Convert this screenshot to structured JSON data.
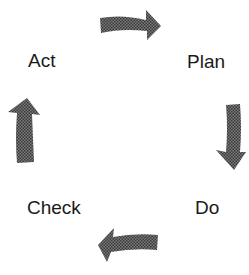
{
  "diagram": {
    "type": "cycle",
    "title": "",
    "nodes": [
      {
        "id": "plan",
        "label": "Plan"
      },
      {
        "id": "do",
        "label": "Do"
      },
      {
        "id": "check",
        "label": "Check"
      },
      {
        "id": "act",
        "label": "Act"
      }
    ],
    "edges": [
      {
        "from": "act",
        "to": "plan",
        "direction": "right"
      },
      {
        "from": "plan",
        "to": "do",
        "direction": "down"
      },
      {
        "from": "do",
        "to": "check",
        "direction": "left"
      },
      {
        "from": "check",
        "to": "act",
        "direction": "up"
      }
    ],
    "colors": {
      "arrow_fill": "#5a5a5a",
      "text": "#1a1a1a",
      "background": "#ffffff"
    }
  }
}
